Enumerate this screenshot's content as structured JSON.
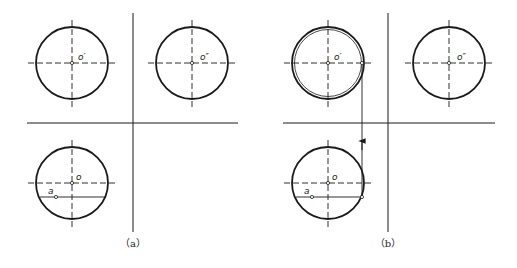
{
  "figure": {
    "panels": [
      {
        "id": "a",
        "caption": "（a）",
        "labels": {
          "front": "o′",
          "side": "o″",
          "top": "o",
          "point": "a"
        }
      },
      {
        "id": "b",
        "caption": "（b）",
        "labels": {
          "front": "o′",
          "side": "o″",
          "top": "o",
          "point": "a"
        }
      }
    ],
    "colors": {
      "line": "#1a1a1a",
      "background": "#ffffff"
    }
  }
}
